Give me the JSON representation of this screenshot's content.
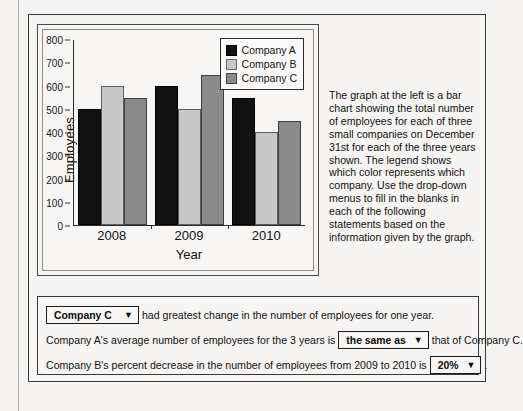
{
  "chart_data": {
    "type": "bar",
    "title": "",
    "xlabel": "Year",
    "ylabel": "Employees",
    "categories": [
      "2008",
      "2009",
      "2010"
    ],
    "series": [
      {
        "name": "Company A",
        "color": "#111111",
        "values": [
          500,
          600,
          550
        ]
      },
      {
        "name": "Company B",
        "color": "#c8c8c8",
        "values": [
          600,
          500,
          400
        ]
      },
      {
        "name": "Company C",
        "color": "#8a8a8a",
        "values": [
          550,
          650,
          450
        ]
      }
    ],
    "series_by_year": {
      "2008": {
        "Company A": 500,
        "Company B": 600,
        "Company C": 550
      },
      "2009": {
        "Company A": 550,
        "Company B": 500,
        "Company C": 650
      },
      "2010": {
        "Company A": 600,
        "Company B": 400,
        "Company C": 450
      }
    },
    "ylim": [
      0,
      800
    ],
    "yticks": [
      "0",
      "100",
      "200",
      "300",
      "400",
      "500",
      "600",
      "700",
      "800"
    ],
    "grid": false,
    "legend_position": "top-right",
    "legend_entries": [
      "Company A",
      "Company B",
      "Company C"
    ]
  },
  "chart": {
    "y_axis_label": "Employees",
    "x_axis_label": "Year",
    "y_ticks": [
      "800",
      "700",
      "600",
      "500",
      "400",
      "300",
      "200",
      "100",
      "0"
    ],
    "x_ticks": [
      "2008",
      "2009",
      "2010"
    ],
    "legend": [
      {
        "label": "Company A",
        "color": "#111111"
      },
      {
        "label": "Company B",
        "color": "#c8c8c8"
      },
      {
        "label": "Company C",
        "color": "#8a8a8a"
      }
    ]
  },
  "instructions": {
    "text": "The graph at the left is a bar chart showing the total number of employees for each of three small companies on December 31st for each of the three years shown. The legend shows which color represents which company. Use the drop-down menus to fill in the blanks in each of the following statements based on the information given by the graph."
  },
  "statements": [
    {
      "id": "statement-1",
      "dropdown_value": "Company C",
      "text_after": " had greatest change in the number of employees for one year.",
      "text_before": ""
    },
    {
      "id": "statement-2",
      "text_before": "Company A's average number of employees for the 3 years is ",
      "dropdown_value": "the same as",
      "text_after": " that of Company C."
    },
    {
      "id": "statement-3",
      "text_before": "Company B's percent decrease in the number of employees from 2009 to 2010 is ",
      "dropdown_value": "20%",
      "text_after": " ."
    }
  ],
  "icons": {
    "caret": "▼"
  }
}
